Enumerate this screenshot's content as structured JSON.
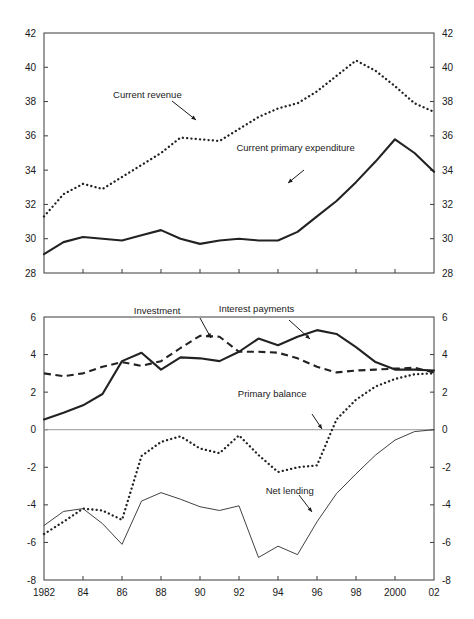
{
  "figure": {
    "background": "#ffffff",
    "ink": "#222222"
  },
  "chart_data": [
    {
      "type": "line",
      "panel": "top",
      "title": "",
      "xlabel": "",
      "ylabel": "",
      "grid": false,
      "legend_position": "inline-annotations",
      "xlim": [
        1982,
        2002
      ],
      "ylim": [
        28,
        42
      ],
      "yticks": [
        28,
        30,
        32,
        34,
        36,
        38,
        40,
        42
      ],
      "ytick_labels": [
        "28",
        "30",
        "32",
        "34",
        "36",
        "38",
        "40",
        "42"
      ],
      "y_axis_both_sides": true,
      "xticks": [
        1982,
        1984,
        1986,
        1988,
        1990,
        1992,
        1994,
        1996,
        1998,
        2000,
        2002
      ],
      "xtick_labels": [
        "1982",
        "84",
        "86",
        "88",
        "90",
        "92",
        "94",
        "96",
        "98",
        "2000",
        "02"
      ],
      "x": [
        1982,
        1983,
        1984,
        1985,
        1986,
        1987,
        1988,
        1989,
        1990,
        1991,
        1992,
        1993,
        1994,
        1995,
        1996,
        1997,
        1998,
        1999,
        2000,
        2001,
        2002
      ],
      "series": [
        {
          "name": "Current revenue",
          "style": "dotted",
          "values": [
            31.3,
            32.6,
            33.2,
            32.9,
            33.6,
            34.3,
            35.0,
            35.9,
            35.8,
            35.7,
            36.4,
            37.1,
            37.6,
            37.9,
            38.6,
            39.5,
            40.4,
            39.8,
            38.9,
            37.9,
            37.4
          ]
        },
        {
          "name": "Current primary expenditure",
          "style": "solid-thick",
          "values": [
            29.1,
            29.8,
            30.1,
            30.0,
            29.9,
            30.2,
            30.5,
            30.0,
            29.7,
            29.9,
            30.0,
            29.9,
            29.9,
            30.4,
            31.3,
            32.2,
            33.3,
            34.5,
            35.8,
            35.0,
            33.9
          ]
        }
      ],
      "annotations": [
        {
          "text": "Current revenue",
          "x": 1987.3,
          "y": 38.2
        },
        {
          "text": "Current primary expenditure",
          "x": 1994.9,
          "y": 35.1
        }
      ]
    },
    {
      "type": "line",
      "panel": "bottom",
      "title": "",
      "xlabel": "",
      "ylabel": "",
      "grid": false,
      "legend_position": "inline-annotations",
      "xlim": [
        1982,
        2002
      ],
      "ylim": [
        -8,
        6
      ],
      "yticks": [
        -8,
        -6,
        -4,
        -2,
        0,
        2,
        4,
        6
      ],
      "ytick_labels": [
        "-8",
        "-6",
        "-4",
        "-2",
        "0",
        "2",
        "4",
        "6"
      ],
      "y_axis_both_sides": true,
      "xticks": [
        1982,
        1984,
        1986,
        1988,
        1990,
        1992,
        1994,
        1996,
        1998,
        2000,
        2002
      ],
      "xtick_labels": [
        "1982",
        "84",
        "86",
        "88",
        "90",
        "92",
        "94",
        "96",
        "98",
        "2000",
        "02"
      ],
      "x": [
        1982,
        1983,
        1984,
        1985,
        1986,
        1987,
        1988,
        1989,
        1990,
        1991,
        1992,
        1993,
        1994,
        1995,
        1996,
        1997,
        1998,
        1999,
        2000,
        2001,
        2002
      ],
      "series": [
        {
          "name": "Interest payments",
          "style": "solid-thick",
          "values": [
            0.55,
            0.9,
            1.3,
            1.9,
            3.65,
            4.1,
            3.2,
            3.85,
            3.8,
            3.65,
            4.15,
            4.85,
            4.5,
            4.95,
            5.3,
            5.1,
            4.4,
            3.6,
            3.2,
            3.2,
            3.15
          ]
        },
        {
          "name": "Investment",
          "style": "dashed",
          "values": [
            3.0,
            2.85,
            3.0,
            3.35,
            3.6,
            3.4,
            3.65,
            4.35,
            5.0,
            4.95,
            4.15,
            4.15,
            4.1,
            3.8,
            3.35,
            3.05,
            3.15,
            3.2,
            3.25,
            3.3,
            3.05
          ]
        },
        {
          "name": "Primary balance",
          "style": "dotted",
          "values": [
            -5.55,
            -4.9,
            -4.2,
            -4.3,
            -4.8,
            -1.4,
            -0.65,
            -0.35,
            -1.0,
            -1.25,
            -0.3,
            -1.35,
            -2.25,
            -2.0,
            -1.9,
            0.55,
            1.6,
            2.3,
            2.7,
            2.95,
            3.0
          ]
        },
        {
          "name": "Net lending",
          "style": "solid-thin",
          "values": [
            -5.1,
            -4.35,
            -4.2,
            -5.0,
            -6.1,
            -3.8,
            -3.35,
            -3.7,
            -4.1,
            -4.3,
            -4.05,
            -6.8,
            -6.2,
            -6.65,
            -4.9,
            -3.4,
            -2.35,
            -1.35,
            -0.55,
            -0.1,
            0.0
          ]
        }
      ],
      "annotations": [
        {
          "text": "Investment",
          "x": 1987.8,
          "y": 6.15
        },
        {
          "text": "Interest payments",
          "x": 1992.9,
          "y": 6.25
        },
        {
          "text": "Primary balance",
          "x": 1993.7,
          "y": 1.75
        },
        {
          "text": "Net lending",
          "x": 1994.6,
          "y": -3.4
        }
      ]
    }
  ]
}
